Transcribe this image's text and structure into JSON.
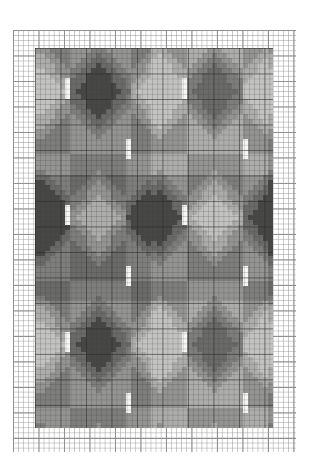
{
  "document": {
    "type": "pixel-grid-chart",
    "title": "",
    "background_color": "#ffffff"
  },
  "graph_paper": {
    "name": "graph-paper-sheet",
    "left": 13,
    "top": 30,
    "width": 283,
    "height": 422,
    "cell_size_px": 5.1,
    "major_every_cells": 5,
    "minor_line_color": "#969696",
    "major_line_color": "#787878",
    "paper_color": "#ffffff"
  },
  "chart": {
    "name": "pattern-chart",
    "left": 35,
    "top": 48,
    "width": 238,
    "height": 380,
    "cols": 47,
    "rows": 75,
    "cell_size_px": 5.1
  },
  "palette": {
    "legend": [
      {
        "key": "W",
        "name": "white",
        "hex": "#f6f6f4"
      },
      {
        "key": "A",
        "name": "light-gray",
        "hex": "#c3c3c1"
      },
      {
        "key": "B",
        "name": "light-mid-gray",
        "hex": "#adadab"
      },
      {
        "key": "C",
        "name": "mid-gray",
        "hex": "#949492"
      },
      {
        "key": "D",
        "name": "mid-dark-gray",
        "hex": "#7e7e7c"
      },
      {
        "key": "E",
        "name": "dark-gray",
        "hex": "#6a6a68"
      },
      {
        "key": "F",
        "name": "darkest-gray",
        "hex": "#474745"
      }
    ],
    "accent_dark": "#474745",
    "accent_light": "#f6f6f4"
  },
  "chart_data": {
    "type": "heatmap",
    "title": "",
    "xlabel": "",
    "ylabel": "",
    "cols": 47,
    "rows": 75,
    "palette_keys": [
      "W",
      "A",
      "B",
      "C",
      "D",
      "E",
      "F"
    ],
    "palette_hex": {
      "W": "#f6f6f4",
      "A": "#c3c3c1",
      "B": "#adadab",
      "C": "#949492",
      "D": "#7e7e7c",
      "E": "#6a6a68",
      "F": "#474745"
    },
    "motif": {
      "tile_w": 23,
      "tile_h": 25,
      "centers_dark": [
        [
          12,
          8
        ],
        [
          35,
          8
        ],
        [
          1,
          33
        ],
        [
          24,
          33
        ],
        [
          46,
          33
        ],
        [
          12,
          58
        ],
        [
          35,
          58
        ]
      ],
      "centers_light": [
        [
          1,
          8
        ],
        [
          24,
          8
        ],
        [
          46,
          8
        ],
        [
          12,
          33
        ],
        [
          35,
          33
        ],
        [
          1,
          58
        ],
        [
          24,
          58
        ],
        [
          46,
          58
        ]
      ],
      "white_bar_positions": [
        [
          6,
          6
        ],
        [
          29,
          6
        ],
        [
          18,
          18
        ],
        [
          41,
          18
        ],
        [
          6,
          31
        ],
        [
          29,
          31
        ],
        [
          18,
          43
        ],
        [
          41,
          43
        ],
        [
          6,
          56
        ],
        [
          29,
          56
        ],
        [
          18,
          68
        ],
        [
          41,
          68
        ]
      ],
      "white_bar_width_cells": 1,
      "white_bar_height_cells": 4
    },
    "rows_rle": [
      "3A 6C 5F 6C 4B 5C 4A 5C 5F",
      "3A 5C 7F 5C 4B 4C 5A 4C 6F",
      "2A 5C 8F 5C 3B 4C 5A 4C 7F",
      "2A 4C 9F 5C 3B 3C 6A 3C 7F",
      "1A 4C 11F 4C 2B 3C 6A 3C 8F"
    ]
  }
}
